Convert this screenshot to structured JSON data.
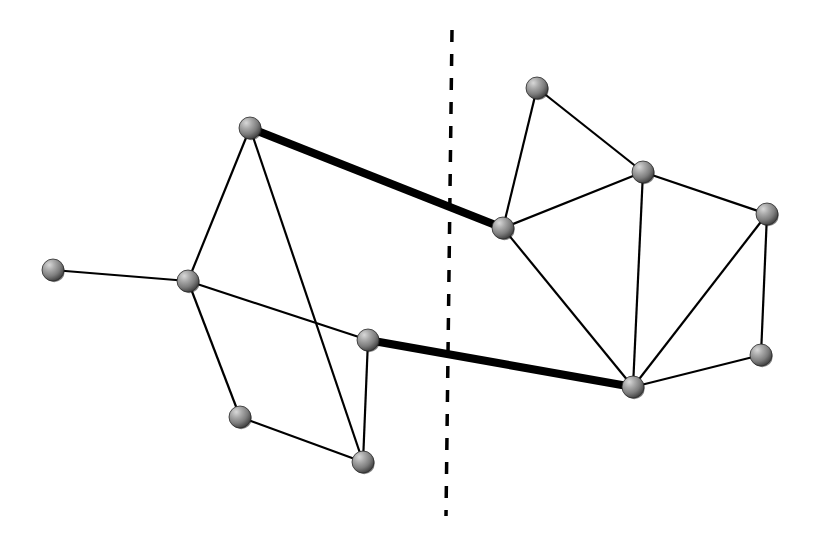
{
  "figure": {
    "width": 815,
    "height": 555,
    "background_color": "#ffffff"
  },
  "style": {
    "node_radius": 11,
    "node_fill_light": "#bdbdbd",
    "node_fill_mid": "#8a8a8a",
    "node_fill_dark": "#4a4a4a",
    "node_outline_color": "#2a2a2a",
    "edge_color": "#000000",
    "edge_width_normal": 2.2,
    "edge_width_bold": 8,
    "cut_line_color": "#000000",
    "cut_line_width": 3.5,
    "cut_line_dash": "12 12"
  },
  "chart_data": {
    "type": "diagram",
    "node_count": 13,
    "edge_count": 19,
    "cut_edge_count": 2,
    "nodes": [
      {
        "id": "n1",
        "label": "n1",
        "x": 53,
        "y": 270,
        "side": "left",
        "degree": 1
      },
      {
        "id": "n2",
        "label": "n2",
        "x": 188,
        "y": 281,
        "side": "left",
        "degree": 4
      },
      {
        "id": "n3",
        "label": "n3",
        "x": 250,
        "y": 128,
        "side": "left",
        "degree": 3
      },
      {
        "id": "n4",
        "label": "n4",
        "x": 240,
        "y": 417,
        "side": "left",
        "degree": 2
      },
      {
        "id": "n5",
        "label": "n5",
        "x": 363,
        "y": 462,
        "side": "left",
        "degree": 3
      },
      {
        "id": "n6",
        "label": "n6",
        "x": 368,
        "y": 340,
        "side": "left",
        "degree": 3
      },
      {
        "id": "n7",
        "label": "n7",
        "x": 503,
        "y": 228,
        "side": "right",
        "degree": 4
      },
      {
        "id": "n8",
        "label": "n8",
        "x": 537,
        "y": 88,
        "side": "right",
        "degree": 2
      },
      {
        "id": "n9",
        "label": "n9",
        "x": 643,
        "y": 172,
        "side": "right",
        "degree": 4
      },
      {
        "id": "n10",
        "label": "n10",
        "x": 767,
        "y": 214,
        "side": "right",
        "degree": 3
      },
      {
        "id": "n11",
        "label": "n11",
        "x": 633,
        "y": 387,
        "side": "right",
        "degree": 5
      },
      {
        "id": "n12",
        "label": "n12",
        "x": 761,
        "y": 355,
        "side": "right",
        "degree": 2
      }
    ],
    "edges": [
      {
        "from": "n1",
        "to": "n2",
        "bold": false,
        "cut": false
      },
      {
        "from": "n2",
        "to": "n3",
        "bold": false,
        "cut": false
      },
      {
        "from": "n2",
        "to": "n6",
        "bold": false,
        "cut": false
      },
      {
        "from": "n2",
        "to": "n4",
        "bold": false,
        "cut": false
      },
      {
        "from": "n3",
        "to": "n5",
        "bold": false,
        "cut": false
      },
      {
        "from": "n3",
        "to": "n7",
        "bold": true,
        "cut": true
      },
      {
        "from": "n4",
        "to": "n5",
        "bold": false,
        "cut": false
      },
      {
        "from": "n5",
        "to": "n6",
        "bold": false,
        "cut": false
      },
      {
        "from": "n6",
        "to": "n11",
        "bold": true,
        "cut": true
      },
      {
        "from": "n7",
        "to": "n8",
        "bold": false,
        "cut": false
      },
      {
        "from": "n7",
        "to": "n9",
        "bold": false,
        "cut": false
      },
      {
        "from": "n7",
        "to": "n11",
        "bold": false,
        "cut": false
      },
      {
        "from": "n8",
        "to": "n9",
        "bold": false,
        "cut": false
      },
      {
        "from": "n9",
        "to": "n10",
        "bold": false,
        "cut": false
      },
      {
        "from": "n9",
        "to": "n11",
        "bold": false,
        "cut": false
      },
      {
        "from": "n10",
        "to": "n11",
        "bold": false,
        "cut": false
      },
      {
        "from": "n10",
        "to": "n12",
        "bold": false,
        "cut": false
      },
      {
        "from": "n11",
        "to": "n12",
        "bold": false,
        "cut": false
      }
    ],
    "cut_line": {
      "label": "bisection-line",
      "x1": 452,
      "y1": 30,
      "x2": 446,
      "y2": 516,
      "dashed": true
    }
  }
}
